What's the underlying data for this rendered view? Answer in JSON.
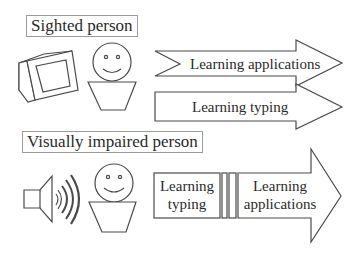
{
  "sighted": {
    "title": "Sighted person",
    "arrows": [
      {
        "label": "Learning applications"
      },
      {
        "label": "Learning typing"
      }
    ]
  },
  "impaired": {
    "title": "Visually impaired person",
    "stages": [
      {
        "line1": "Learning",
        "line2": "typing"
      },
      {
        "line1": "Learning",
        "line2": "applications"
      }
    ]
  },
  "colors": {
    "stroke": "#4a4a4a",
    "text": "#2a2a2a",
    "box_border": "#9a9a9a"
  }
}
